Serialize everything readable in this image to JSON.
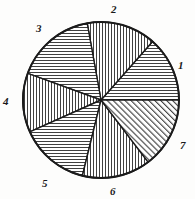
{
  "figure": {
    "title": "",
    "type": "hatched-pie-diagram",
    "center": {
      "x": 101,
      "y": 100
    },
    "radius": 78,
    "stroke_color": "#1b1b1b",
    "hatch_color": "#2a2a2a",
    "background": "#fdfdfc"
  },
  "chart_data": {
    "type": "pie",
    "title": "",
    "xlabel": "",
    "ylabel": "",
    "categories": [
      "1",
      "2",
      "3",
      "4",
      "5",
      "6",
      "7"
    ],
    "values": [
      48.6,
      51.6,
      59.8,
      44.1,
      52.1,
      51.0,
      53.0
    ],
    "units": "degrees",
    "grid": false,
    "legend": "none",
    "sectors": [
      {
        "label": "1",
        "start_deg": 0,
        "end_deg": 48.6,
        "sweep_deg": 48.6,
        "hatch": "horizontal",
        "label_x": 178,
        "label_y": 60
      },
      {
        "label": "2",
        "start_deg": 48.6,
        "end_deg": 100.2,
        "sweep_deg": 51.6,
        "hatch": "vertical",
        "label_x": 111,
        "label_y": 4
      },
      {
        "label": "3",
        "start_deg": 100.2,
        "end_deg": 160.0,
        "sweep_deg": 59.8,
        "hatch": "horizontal",
        "label_x": 36,
        "label_y": 23
      },
      {
        "label": "4",
        "start_deg": 160.0,
        "end_deg": 204.1,
        "sweep_deg": 44.1,
        "hatch": "vertical",
        "label_x": 3,
        "label_y": 96
      },
      {
        "label": "5",
        "start_deg": 204.1,
        "end_deg": 256.2,
        "sweep_deg": 52.1,
        "hatch": "horizontal",
        "label_x": 42,
        "label_y": 178
      },
      {
        "label": "6",
        "start_deg": 256.2,
        "end_deg": 307.2,
        "sweep_deg": 51.0,
        "hatch": "vertical",
        "label_x": 110,
        "label_y": 186
      },
      {
        "label": "7",
        "start_deg": 307.2,
        "end_deg": 360.0,
        "sweep_deg": 53.0,
        "hatch": "diagonal",
        "label_x": 180,
        "label_y": 140
      }
    ]
  }
}
